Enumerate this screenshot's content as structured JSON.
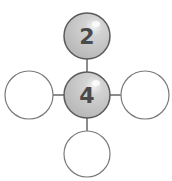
{
  "diagram": {
    "type": "number-bond",
    "nodes": [
      {
        "id": "top",
        "label": "2",
        "filled": true
      },
      {
        "id": "center",
        "label": "4",
        "filled": true
      },
      {
        "id": "left",
        "label": "",
        "filled": false
      },
      {
        "id": "right",
        "label": "",
        "filled": false
      },
      {
        "id": "bottom",
        "label": "",
        "filled": false
      }
    ],
    "colors": {
      "filled_fill": "#c4c4c4",
      "filled_stroke": "#5a5a5a",
      "empty_fill": "#ffffff",
      "empty_stroke": "#7a7a7a",
      "connector": "#666666",
      "text": "#4a4a4a"
    }
  }
}
